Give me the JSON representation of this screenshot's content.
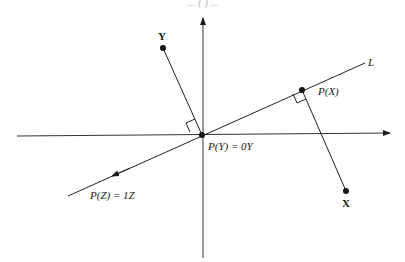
{
  "diagram": {
    "type": "projection-onto-line",
    "top_caption_partial": "... (  ) ...",
    "line_label": "L",
    "points": {
      "X": {
        "label": "X",
        "proj_label": "P(X)"
      },
      "Y": {
        "label": "Y",
        "proj_label": "P(Y) = 0Y"
      },
      "Z": {
        "proj_label": "P(Z) = 1Z"
      }
    },
    "colors": {
      "ink": "#1a1a1a",
      "background": "#ffffff"
    }
  }
}
